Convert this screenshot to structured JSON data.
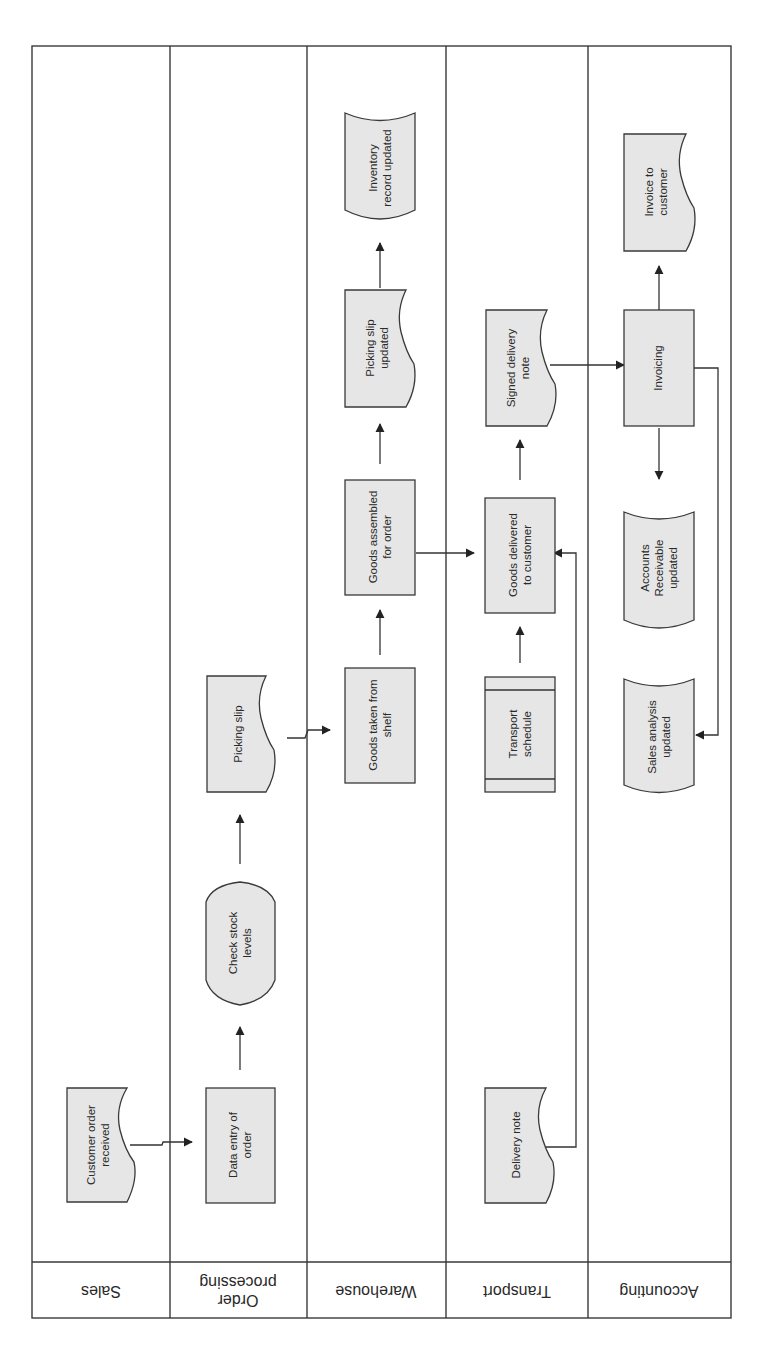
{
  "diagram": {
    "type": "swimlane-flowchart",
    "orientation": "rotated",
    "lanes": [
      {
        "id": "sales",
        "label": "Sales"
      },
      {
        "id": "order_processing",
        "label_line1": "Order",
        "label_line2": "processing"
      },
      {
        "id": "warehouse",
        "label": "Warehouse"
      },
      {
        "id": "transport",
        "label": "Transport"
      },
      {
        "id": "accounting",
        "label": "Accounting"
      }
    ],
    "nodes": {
      "customer_order": {
        "shape": "document",
        "lane": "Sales",
        "line1": "Customer order",
        "line2": "received"
      },
      "data_entry": {
        "shape": "process",
        "lane": "Order processing",
        "line1": "Data entry of",
        "line2": "order"
      },
      "check_stock": {
        "shape": "display",
        "lane": "Order processing",
        "line1": "Check stock",
        "line2": "levels"
      },
      "picking_slip": {
        "shape": "document",
        "lane": "Order processing",
        "line1": "Picking slip"
      },
      "goods_taken": {
        "shape": "process",
        "lane": "Warehouse",
        "line1": "Goods taken from",
        "line2": "shelf"
      },
      "goods_assembled": {
        "shape": "process",
        "lane": "Warehouse",
        "line1": "Goods assembled",
        "line2": "for order"
      },
      "picking_slip_updated": {
        "shape": "document",
        "lane": "Warehouse",
        "line1": "Picking slip",
        "line2": "updated"
      },
      "inventory_updated": {
        "shape": "stored-data",
        "lane": "Warehouse",
        "line1": "Inventory",
        "line2": "record updated"
      },
      "delivery_note": {
        "shape": "document",
        "lane": "Transport",
        "line1": "Delivery note"
      },
      "transport_schedule": {
        "shape": "internal-storage",
        "lane": "Transport",
        "line1": "Transport",
        "line2": "schedule"
      },
      "goods_delivered": {
        "shape": "process",
        "lane": "Transport",
        "line1": "Goods delivered",
        "line2": "to customer"
      },
      "signed_delivery_note": {
        "shape": "document",
        "lane": "Transport",
        "line1": "Signed delivery",
        "line2": "note"
      },
      "sales_analysis": {
        "shape": "stored-data",
        "lane": "Accounting",
        "line1": "Sales analysis",
        "line2": "updated"
      },
      "accounts_receivable": {
        "shape": "stored-data",
        "lane": "Accounting",
        "line1": "Accounts",
        "line2": "Receivable",
        "line3": "updated"
      },
      "invoicing": {
        "shape": "process",
        "lane": "Accounting",
        "line1": "Invoicing"
      },
      "invoice_to_customer": {
        "shape": "document",
        "lane": "Accounting",
        "line1": "Invoice to",
        "line2": "customer"
      }
    },
    "edges": [
      {
        "from": "Customer order received",
        "to": "Data entry of order"
      },
      {
        "from": "Data entry of order",
        "to": "Check stock levels"
      },
      {
        "from": "Check stock levels",
        "to": "Picking slip"
      },
      {
        "from": "Picking slip",
        "to": "Goods taken from shelf"
      },
      {
        "from": "Goods taken from shelf",
        "to": "Goods assembled for order"
      },
      {
        "from": "Goods assembled for order",
        "to": "Picking slip updated"
      },
      {
        "from": "Picking slip updated",
        "to": "Inventory record updated"
      },
      {
        "from": "Goods assembled for order",
        "to": "Goods delivered to customer"
      },
      {
        "from": "Transport schedule",
        "to": "Goods delivered to customer"
      },
      {
        "from": "Delivery note",
        "to": "Goods delivered to customer"
      },
      {
        "from": "Goods delivered to customer",
        "to": "Signed delivery note"
      },
      {
        "from": "Signed delivery note",
        "to": "Invoicing"
      },
      {
        "from": "Invoicing",
        "to": "Invoice to customer"
      },
      {
        "from": "Invoicing",
        "to": "Accounts Receivable updated"
      },
      {
        "from": "Invoicing",
        "to": "Sales analysis updated"
      }
    ],
    "colors": {
      "shape_fill": "#e6e6e6",
      "stroke": "#3a3a3a",
      "background": "#ffffff"
    }
  }
}
